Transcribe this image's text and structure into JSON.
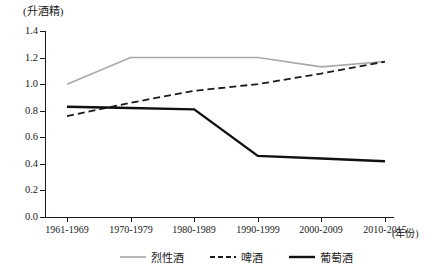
{
  "chart_data": {
    "type": "line",
    "title": "",
    "ylabel": "(升酒精)",
    "xlabel": "(年份)",
    "categories": [
      "1961-1969",
      "1970-1979",
      "1980-1989",
      "1990-1999",
      "2000-2009",
      "2010-2015"
    ],
    "ylim": [
      0.0,
      1.4
    ],
    "yticks": [
      "0.0",
      "0.2",
      "0.4",
      "0.6",
      "0.8",
      "1.0",
      "1.2",
      "1.4"
    ],
    "ytick_values": [
      0.0,
      0.2,
      0.4,
      0.6,
      0.8,
      1.0,
      1.2,
      1.4
    ],
    "grid": false,
    "legend_position": "bottom",
    "series": [
      {
        "name": "烈性酒",
        "style": "solid",
        "color": "#a8a8a8",
        "width": 1.6,
        "values": [
          1.0,
          1.2,
          1.2,
          1.2,
          1.13,
          1.17
        ]
      },
      {
        "name": "啤酒",
        "style": "dashed",
        "color": "#1a1a1a",
        "width": 1.8,
        "values": [
          0.76,
          0.86,
          0.95,
          1.0,
          1.08,
          1.17
        ]
      },
      {
        "name": "葡萄酒",
        "style": "solid",
        "color": "#111111",
        "width": 2.4,
        "values": [
          0.83,
          0.82,
          0.81,
          0.46,
          0.44,
          0.42
        ]
      }
    ]
  },
  "legend": {
    "items": [
      {
        "label": "烈性酒"
      },
      {
        "label": "啤酒"
      },
      {
        "label": "葡萄酒"
      }
    ]
  }
}
